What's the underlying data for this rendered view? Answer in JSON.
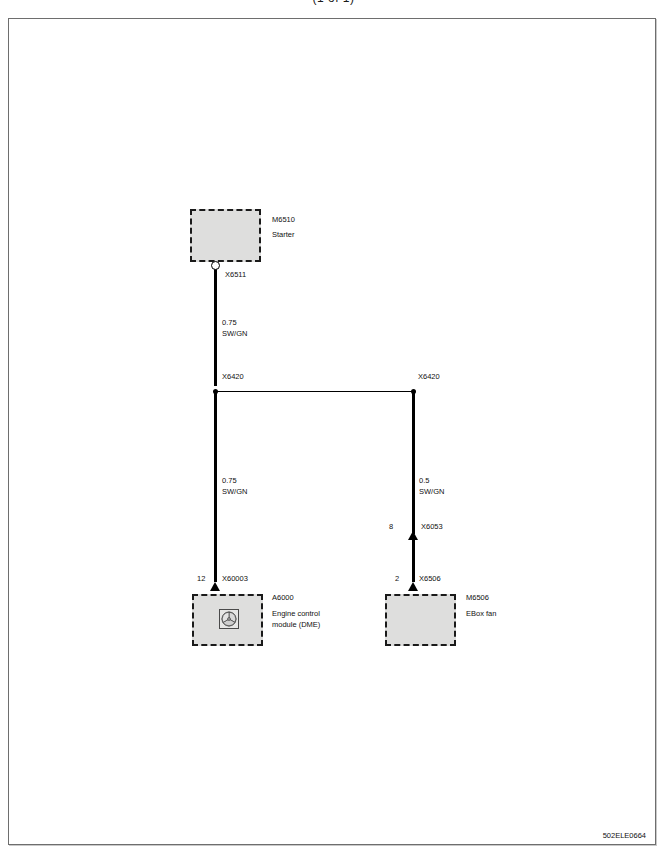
{
  "header": {
    "clipped_title": "(1 of 1)"
  },
  "diagram": {
    "components": [
      {
        "id": "M6510",
        "name": "Starter",
        "connector": "X6511",
        "connector_type": "ring-terminal"
      },
      {
        "id": "A6000",
        "name_line1": "Engine control",
        "name_line2": "module  (DME)",
        "connector": "X60003",
        "pin": "12",
        "connector_type": "plug-arrow",
        "symbol": "fan-motor-icon"
      },
      {
        "id": "M6506",
        "name": "EBox fan",
        "connector": "X6506",
        "pin": "2",
        "connector_type": "plug-arrow"
      }
    ],
    "junctions": [
      {
        "label": "X6420",
        "side": "left"
      },
      {
        "label": "X6420",
        "side": "right"
      }
    ],
    "inline_connectors": [
      {
        "label": "X6053",
        "pin": "8"
      }
    ],
    "wires": [
      {
        "name": "starter-to-junction",
        "size": "0.75",
        "color_code": "SW/GN"
      },
      {
        "name": "junction-to-dme",
        "size": "0.75",
        "color_code": "SW/GN"
      },
      {
        "name": "junction-to-ebox-fan",
        "size": "0.5",
        "color_code": "SW/GN"
      }
    ]
  },
  "footer": {
    "document_code": "502ELE0664"
  },
  "colors": {
    "wire": "#000000",
    "component_fill": "#dededd",
    "frame_border": "#6e6e6e"
  }
}
